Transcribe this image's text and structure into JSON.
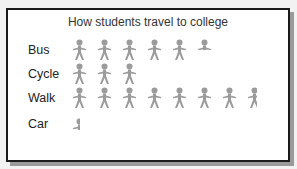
{
  "chart_data": {
    "type": "pictogram",
    "title": "How students travel to college",
    "categories": [
      "Bus",
      "Cycle",
      "Walk",
      "Car"
    ],
    "values": [
      5.5,
      3,
      7.75,
      0.25
    ],
    "icon": "person-icon",
    "icon_color": "#9b9b9b",
    "legend": "",
    "xlabel": "",
    "ylabel": ""
  },
  "rows": [
    {
      "label": "Bus",
      "full": 5,
      "partial": 0.5
    },
    {
      "label": "Cycle",
      "full": 3,
      "partial": 0
    },
    {
      "label": "Walk",
      "full": 7,
      "partial": 0.75
    },
    {
      "label": "Car",
      "full": 0,
      "partial": 0.25
    }
  ]
}
